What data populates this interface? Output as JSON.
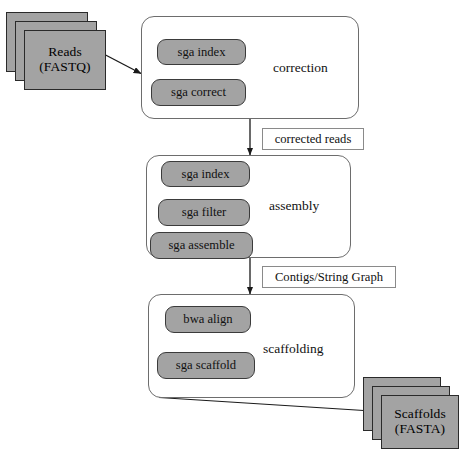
{
  "diagram": {
    "colors": {
      "node_fill": "#a3a3a3",
      "node_stroke": "#2a2a2a",
      "stage_stroke": "#6d6d6d",
      "pill_stroke": "#3b3b3b",
      "edge_stroke": "#1a1a1a",
      "label_box_stroke": "#8a8a8a",
      "background": "#ffffff",
      "text": "#111111"
    },
    "input": {
      "name": "reads-node",
      "line1": "Reads",
      "line2": "(FASTQ)"
    },
    "output": {
      "name": "scaffolds-node",
      "line1": "Scaffolds",
      "line2": "(FASTA)"
    },
    "stages": [
      {
        "id": "correction",
        "title": "correction",
        "steps": [
          {
            "label": "sga  index"
          },
          {
            "label": "sga correct"
          }
        ]
      },
      {
        "id": "assembly",
        "title": "assembly",
        "steps": [
          {
            "label": "sga  index"
          },
          {
            "label": "sga filter"
          },
          {
            "label": "sga assemble"
          }
        ]
      },
      {
        "id": "scaffolding",
        "title": "scaffolding",
        "steps": [
          {
            "label": "bwa align"
          },
          {
            "label": "sga scaffold"
          }
        ]
      }
    ],
    "edge_labels": [
      {
        "id": "corrected-reads",
        "label": "corrected reads"
      },
      {
        "id": "contigs-string-graph",
        "label": "Contigs/String Graph"
      }
    ]
  }
}
